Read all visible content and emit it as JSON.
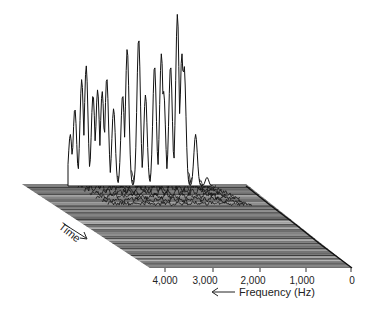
{
  "chart_data": {
    "type": "waterfall",
    "title": "",
    "xlabel": "Frequency (Hz)",
    "ylabel": "Time",
    "x_direction": "decreasing-left-to-right",
    "x_ticks": [
      "4,000",
      "3,000",
      "2,000",
      "1,000",
      "0"
    ],
    "x_tick_values": [
      4000,
      3000,
      2000,
      1000,
      0
    ],
    "xlim": [
      4000,
      0
    ],
    "grid": false,
    "legend": null,
    "front_spectrum": {
      "frequency_hz": [
        3900,
        3800,
        3650,
        3550,
        3400,
        3300,
        3200,
        3100,
        2950,
        2750,
        2650,
        2400,
        2250,
        2050,
        1900,
        1850,
        1700,
        1550,
        1450,
        1400,
        1150,
        900
      ],
      "relative_amplitude": [
        0.3,
        0.45,
        0.62,
        0.7,
        0.53,
        0.56,
        0.55,
        0.63,
        0.45,
        0.53,
        0.8,
        0.86,
        0.53,
        0.7,
        0.77,
        0.55,
        0.7,
        1.0,
        0.77,
        0.7,
        0.3,
        0.05
      ]
    }
  },
  "labels": {
    "x_axis_title": "Frequency (Hz)",
    "x_axis_arrow": "←",
    "time_axis_title": "Time",
    "ticks": [
      "4,000",
      "3,000",
      "2,000",
      "1,000",
      "0"
    ]
  }
}
